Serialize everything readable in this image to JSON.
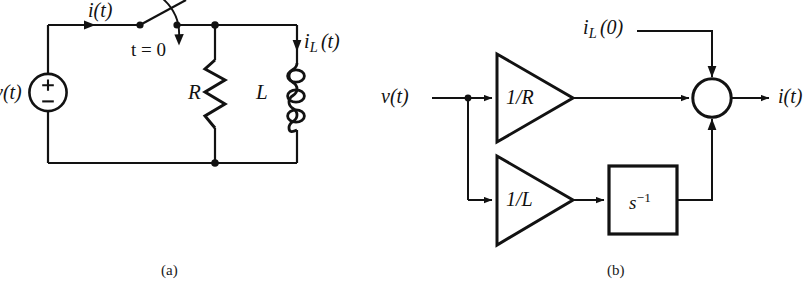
{
  "figure": {
    "kind": "two-panel-engineering-diagram",
    "background_color": "#ffffff",
    "line_color": "#121212",
    "panels": [
      {
        "id": "a",
        "caption": "(a)",
        "type": "circuit-schematic",
        "description": "Series RL circuit with voltage source and switch"
      },
      {
        "id": "b",
        "caption": "(b)",
        "type": "block-diagram",
        "description": "Signal flow block diagram with gain triangles, integrator and summing junction"
      }
    ]
  },
  "circuit": {
    "source_label": "v(t)",
    "source_plus": "+",
    "source_minus": "−",
    "current_label": "i(t)",
    "switch_label": "t = 0",
    "resistor_label": "R",
    "inductor_label": "L",
    "inductor_current_label": "i",
    "inductor_current_sub": "L",
    "inductor_current_arg": "(t)",
    "caption": "(a)"
  },
  "block_diagram": {
    "input_label": "v(t)",
    "output_label": "i(t)",
    "initial_condition_label": "i",
    "initial_condition_sub": "L",
    "initial_condition_arg": "(0)",
    "gain_top_label": "1/R",
    "gain_bottom_label": "1/L",
    "integrator_label": "s",
    "integrator_exponent": "−1",
    "summing_junction": "sum-circle",
    "caption": "(b)"
  },
  "colors": {
    "ink": "#121212",
    "paper": "#ffffff"
  }
}
